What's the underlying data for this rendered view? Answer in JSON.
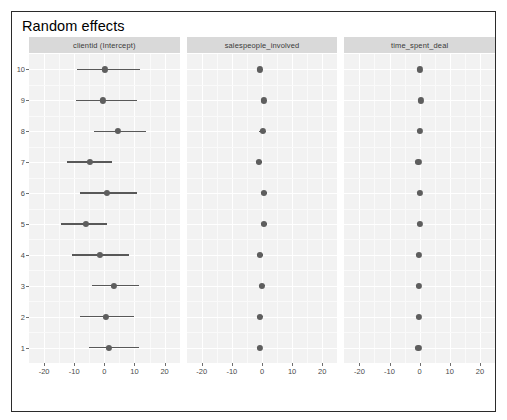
{
  "window": {
    "title": "Random effects",
    "border_color": "#2b2b2b",
    "background": "#ffffff"
  },
  "style": {
    "panel_fill": "#f2f2f2",
    "strip_fill": "#d9d9d9",
    "grid_color": "#ffffff",
    "point_color": "#5e5e5e",
    "interval_color": "#585858",
    "axis_text_color": "#4a4a4a"
  },
  "chart_data": {
    "type": "scatter",
    "title": "Random effects",
    "xlabel": "",
    "ylabel": "",
    "grid": true,
    "legend": "none",
    "xlim": [
      -25,
      25
    ],
    "xticks": [
      -20,
      -10,
      0,
      10,
      20
    ],
    "xtick_labels": [
      "-20",
      "-10",
      "0",
      "10",
      "20"
    ],
    "yticks": [
      1,
      2,
      3,
      4,
      5,
      6,
      7,
      8,
      9,
      10
    ],
    "ytick_labels": [
      "1",
      "2",
      "3",
      "4",
      "5",
      "6",
      "7",
      "8",
      "9",
      "10"
    ],
    "facet_order": [
      "clientid (Intercept)",
      "salespeople_involved",
      "time_spent_deal"
    ],
    "panels": [
      {
        "facet": "clientid (Intercept)",
        "groups": [
          "10",
          "9",
          "8",
          "7",
          "6",
          "5",
          "4",
          "3",
          "2",
          "1"
        ],
        "estimates": [
          0.2,
          -0.6,
          4.5,
          -4.8,
          0.8,
          -6.2,
          -1.4,
          3.2,
          0.4,
          1.6
        ],
        "conf_low": [
          -9.0,
          -9.4,
          -3.4,
          -12.4,
          -8.0,
          -14.4,
          -10.6,
          -4.0,
          -8.2,
          -5.2
        ],
        "conf_high": [
          12.0,
          10.8,
          13.8,
          2.4,
          10.8,
          1.0,
          8.2,
          11.6,
          10.0,
          11.4
        ]
      },
      {
        "facet": "salespeople_involved",
        "groups": [
          "10",
          "9",
          "8",
          "7",
          "6",
          "5",
          "4",
          "3",
          "2",
          "1"
        ],
        "estimates": [
          -0.7,
          0.6,
          0.2,
          -1.0,
          0.6,
          0.7,
          -0.6,
          0.0,
          -0.6,
          -0.8
        ],
        "conf_low": [
          -1.6,
          -0.3,
          -0.9,
          -1.9,
          -0.3,
          -0.2,
          -1.5,
          -1.0,
          -1.5,
          -1.7
        ],
        "conf_high": [
          0.2,
          1.6,
          1.2,
          -0.1,
          1.6,
          1.7,
          0.3,
          1.0,
          0.3,
          0.1
        ]
      },
      {
        "facet": "time_spent_deal",
        "groups": [
          "10",
          "9",
          "8",
          "7",
          "6",
          "5",
          "4",
          "3",
          "2",
          "1"
        ],
        "estimates": [
          0.0,
          0.3,
          0.2,
          -0.4,
          0.2,
          0.2,
          -0.3,
          -0.2,
          -0.3,
          -0.4
        ],
        "conf_low": [
          -0.2,
          0.1,
          0.0,
          -0.6,
          0.0,
          0.0,
          -0.5,
          -0.4,
          -0.5,
          -0.6
        ],
        "conf_high": [
          0.2,
          0.5,
          0.4,
          -0.2,
          0.4,
          0.4,
          -0.1,
          0.0,
          -0.1,
          -0.2
        ]
      }
    ]
  }
}
